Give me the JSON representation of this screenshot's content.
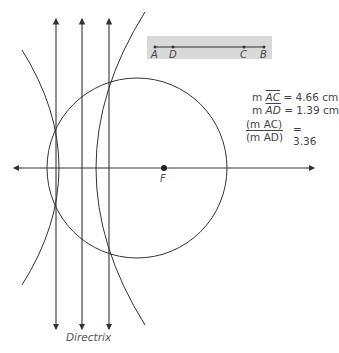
{
  "slider_panel": {
    "points": [
      {
        "label": "A",
        "x": 155
      },
      {
        "label": "D",
        "x": 173
      },
      {
        "label": "C",
        "x": 244
      },
      {
        "label": "B",
        "x": 264
      }
    ]
  },
  "measurements": {
    "ac": {
      "prefix": "m ",
      "segment": "AC",
      "value": "= 4.66 cm"
    },
    "ad": {
      "prefix": "m ",
      "segment": "AD",
      "value": "= 1.39 cm"
    },
    "ratio": {
      "numerator": "(m AC)",
      "denominator": "(m AD)",
      "value": "= 3.36"
    }
  },
  "focus_label": "F",
  "directrix_label": "Directrix",
  "colors": {
    "line": "#333333",
    "panel": "#d9d9d9",
    "text": "#444444"
  }
}
